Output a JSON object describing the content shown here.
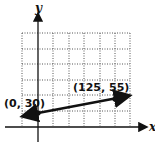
{
  "diagram": {
    "axes": {
      "x_label": "x",
      "y_label": "y"
    },
    "points": [
      {
        "label": "(0, 30)",
        "x": 0,
        "y": 30
      },
      {
        "label": "(125, 55)",
        "x": 125,
        "y": 55
      }
    ],
    "grid": {
      "columns": 7,
      "rows": 6,
      "style": "dotted"
    },
    "colors": {
      "line": "#111111",
      "grid": "#555555",
      "background": "#ffffff"
    }
  }
}
